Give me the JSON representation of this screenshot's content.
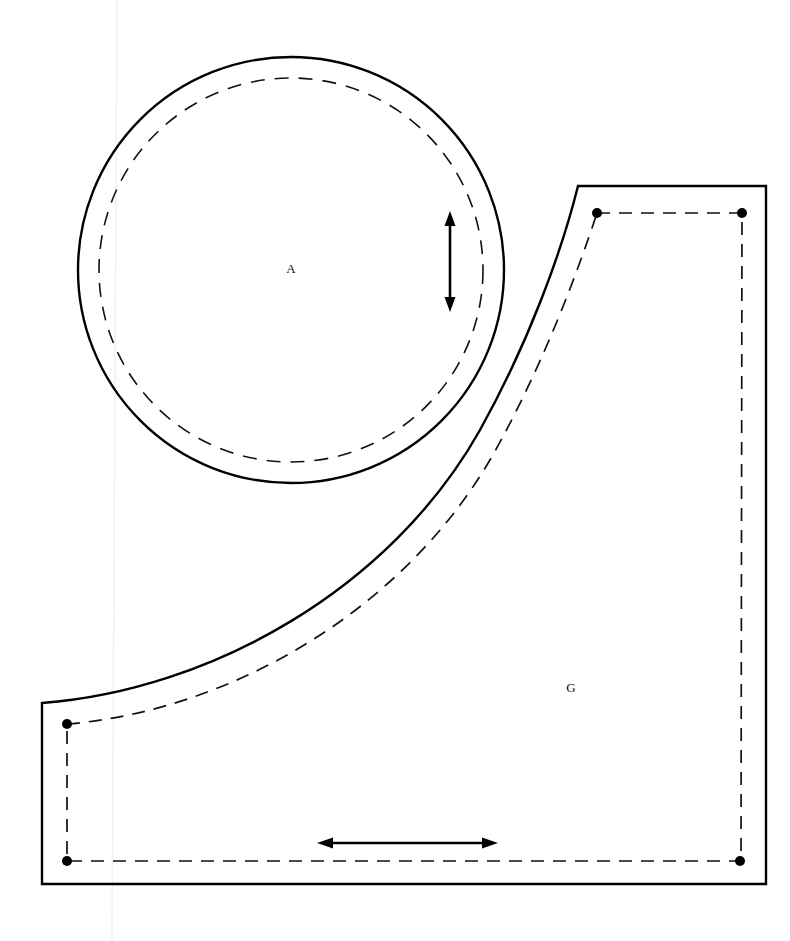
{
  "sheet": {
    "title": "Sewing Pattern Sheet",
    "width": 790,
    "height": 941,
    "background_color": "#ffffff",
    "ink_color": "#000000"
  },
  "pieces": [
    {
      "id": "A",
      "label": "A",
      "shape": "circle",
      "label_x": 291,
      "label_y": 270,
      "cut_line": {
        "style": "solid",
        "center_x": 291,
        "center_y": 270,
        "radius": 213
      },
      "seam_line": {
        "style": "dashed",
        "center_x": 291,
        "center_y": 270,
        "radius": 192
      },
      "grain_line": {
        "orientation": "vertical",
        "x": 450,
        "y_start": 213,
        "y_end": 310,
        "arrowheads": "both"
      }
    },
    {
      "id": "G",
      "label": "G",
      "shape": "quarter-round-notched-rectangle",
      "label_x": 571,
      "label_y": 689,
      "cut_line": {
        "style": "solid",
        "top_y": 186,
        "right_x": 766,
        "bottom_y": 884,
        "left_x": 42,
        "top_left_x": 578,
        "left_bottom_y": 703,
        "curve_description": "concave arc from lower-left (42,703) sweeping up to upper-right (578,186)"
      },
      "seam_line": {
        "style": "dashed",
        "top_y": 213,
        "right_x": 741,
        "bottom_y": 861,
        "left_x": 67,
        "top_left_x": 597,
        "left_bottom_y": 724
      },
      "corner_dots": [
        {
          "name": "seam-dot-top-left",
          "x": 597,
          "y": 213
        },
        {
          "name": "seam-dot-top-right",
          "x": 742,
          "y": 213
        },
        {
          "name": "seam-dot-bottom-right",
          "x": 740,
          "y": 861
        },
        {
          "name": "seam-dot-bottom-left",
          "x": 67,
          "y": 861
        },
        {
          "name": "seam-dot-left-curve-start",
          "x": 67,
          "y": 724
        }
      ],
      "grain_line": {
        "orientation": "horizontal",
        "y": 843,
        "x_start": 318,
        "x_end": 497,
        "arrowheads": "both"
      }
    }
  ],
  "legend": {
    "solid_line_meaning": "cutting line",
    "dashed_line_meaning": "seam line",
    "arrow_meaning": "grain line",
    "dot_meaning": "seam corner match point"
  }
}
